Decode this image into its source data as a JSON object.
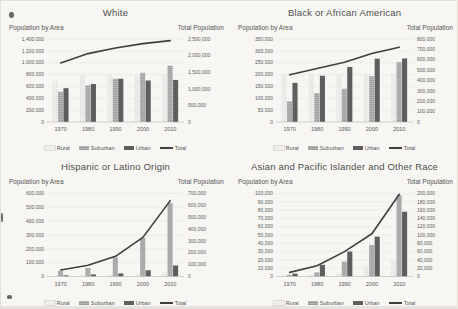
{
  "page": {
    "background": "#f7f6f3"
  },
  "axis_labels": {
    "left": "Population by Area",
    "right": "Total Population"
  },
  "legend": {
    "rural": "Rural",
    "suburban": "Suburban",
    "urban": "Urban",
    "total": "Total"
  },
  "colors": {
    "rural_fill": "#efeeec",
    "rural_dot": "#cccccc",
    "suburban_fill": "#b4b4b4",
    "suburban_stripe": "#9b9b9b",
    "urban_fill": "#5e5e5e",
    "total_line": "#3f3f3f",
    "grid": "#e3e3e3",
    "axis_line": "#b5b5b5",
    "text": "#595959"
  },
  "chart_data": [
    {
      "type": "bar",
      "title": "White",
      "categories": [
        "1970",
        "1980",
        "1990",
        "2000",
        "2010"
      ],
      "series": [
        {
          "name": "Rural",
          "axis": "left",
          "values": [
            700000,
            790000,
            800000,
            790000,
            820000
          ]
        },
        {
          "name": "Suburban",
          "axis": "left",
          "values": [
            510000,
            620000,
            730000,
            830000,
            950000
          ]
        },
        {
          "name": "Urban",
          "axis": "left",
          "values": [
            570000,
            640000,
            730000,
            700000,
            710000
          ]
        },
        {
          "name": "Total",
          "type": "line",
          "axis": "right",
          "values": [
            1780000,
            2060000,
            2230000,
            2360000,
            2450000
          ]
        }
      ],
      "left_axis": {
        "label": "Population by Area",
        "min": 0,
        "max": 1400000,
        "step": 200000
      },
      "right_axis": {
        "label": "Total Population",
        "min": 0,
        "max": 2500000,
        "step": 500000
      },
      "grid": true,
      "legend_position": "bottom"
    },
    {
      "type": "bar",
      "title": "Black or African American",
      "categories": [
        "1970",
        "1980",
        "1990",
        "2000",
        "2010"
      ],
      "series": [
        {
          "name": "Rural",
          "axis": "left",
          "values": [
            200000,
            205000,
            200000,
            205000,
            205000
          ]
        },
        {
          "name": "Suburban",
          "axis": "left",
          "values": [
            88000,
            122000,
            140000,
            193000,
            252000
          ]
        },
        {
          "name": "Urban",
          "axis": "left",
          "values": [
            165000,
            195000,
            232000,
            267000,
            268000
          ]
        },
        {
          "name": "Total",
          "type": "line",
          "axis": "right",
          "values": [
            455000,
            515000,
            575000,
            660000,
            720000
          ]
        }
      ],
      "left_axis": {
        "label": "Population by Area",
        "min": 0,
        "max": 350000,
        "step": 50000
      },
      "right_axis": {
        "label": "Total Population",
        "min": 0,
        "max": 800000,
        "step": 100000
      },
      "grid": true,
      "legend_position": "bottom"
    },
    {
      "type": "bar",
      "title": "Hispanic or Latino Origin",
      "categories": [
        "1970",
        "1980",
        "1990",
        "2000",
        "2010"
      ],
      "series": [
        {
          "name": "Rural",
          "axis": "left",
          "values": [
            8000,
            10000,
            12000,
            15000,
            30000
          ]
        },
        {
          "name": "Suburban",
          "axis": "left",
          "values": [
            40000,
            62000,
            140000,
            280000,
            530000
          ]
        },
        {
          "name": "Urban",
          "axis": "left",
          "values": [
            8000,
            15000,
            22000,
            45000,
            80000
          ]
        },
        {
          "name": "Total",
          "type": "line",
          "axis": "right",
          "values": [
            55000,
            95000,
            170000,
            330000,
            640000
          ]
        }
      ],
      "left_axis": {
        "label": "Population by Area",
        "min": 0,
        "max": 600000,
        "step": 100000
      },
      "right_axis": {
        "label": "Total Population",
        "min": 0,
        "max": 700000,
        "step": 100000
      },
      "grid": true,
      "legend_position": "bottom"
    },
    {
      "type": "bar",
      "title": "Asian and Pacific Islander and Other Race",
      "categories": [
        "1970",
        "1980",
        "1990",
        "2000",
        "2010"
      ],
      "series": [
        {
          "name": "Rural",
          "axis": "left",
          "values": [
            1000,
            2000,
            4000,
            13000,
            20000
          ]
        },
        {
          "name": "Suburban",
          "axis": "left",
          "values": [
            2000,
            5000,
            18000,
            38000,
            98000
          ]
        },
        {
          "name": "Urban",
          "axis": "left",
          "values": [
            3500,
            14000,
            30000,
            48000,
            78000
          ]
        },
        {
          "name": "Total",
          "type": "line",
          "axis": "right",
          "values": [
            10000,
            26000,
            60000,
            103000,
            198000
          ]
        }
      ],
      "left_axis": {
        "label": "Population by Area",
        "min": 0,
        "max": 100000,
        "step": 10000
      },
      "right_axis": {
        "label": "Total Population",
        "min": 0,
        "max": 200000,
        "step": 20000
      },
      "grid": true,
      "legend_position": "bottom"
    }
  ]
}
